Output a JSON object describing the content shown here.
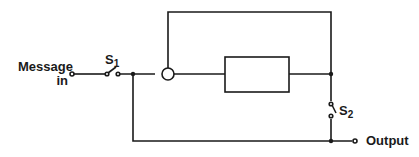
{
  "diagram": {
    "labels": {
      "input_line1": "Message",
      "input_line2": "in",
      "switch1": "S",
      "switch1_sub": "1",
      "switch2": "S",
      "switch2_sub": "2",
      "output": "Output"
    },
    "components": [
      {
        "id": "input-terminal",
        "type": "terminal"
      },
      {
        "id": "switch-s1",
        "type": "switch",
        "label": "S1"
      },
      {
        "id": "junction-left",
        "type": "node"
      },
      {
        "id": "circle-node",
        "type": "summing-node"
      },
      {
        "id": "process-box",
        "type": "block"
      },
      {
        "id": "junction-right",
        "type": "node"
      },
      {
        "id": "switch-s2",
        "type": "switch",
        "label": "S2"
      },
      {
        "id": "junction-bottom-right",
        "type": "node"
      },
      {
        "id": "output-terminal",
        "type": "terminal"
      }
    ],
    "colors": {
      "line": "#1a1a1a",
      "background": "#ffffff"
    }
  }
}
